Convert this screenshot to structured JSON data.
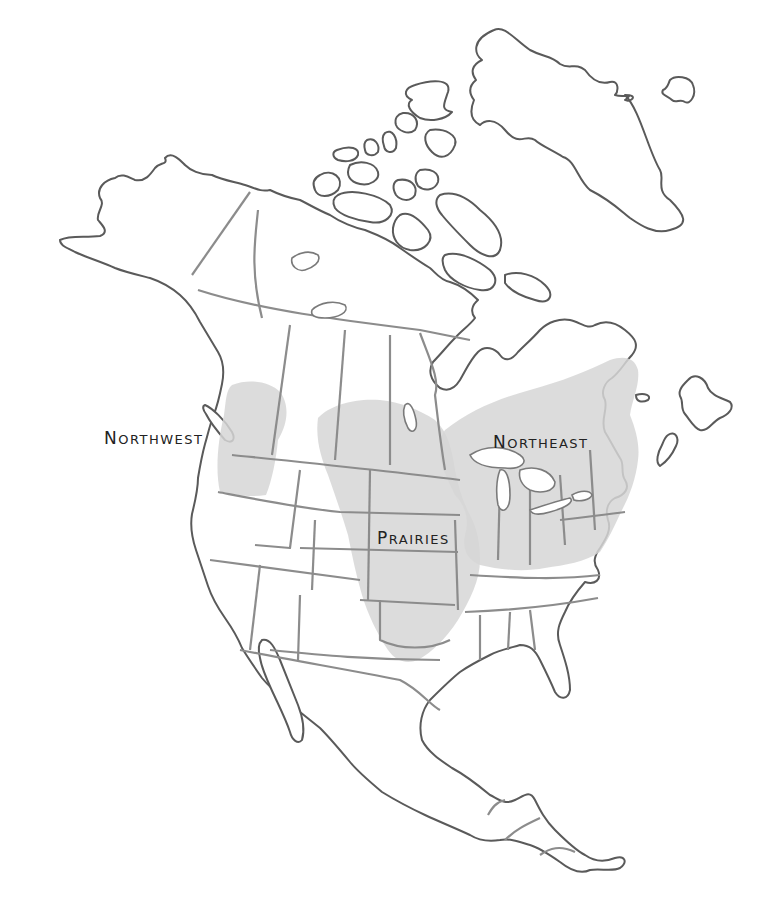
{
  "map": {
    "title": "North America regions",
    "colors": {
      "background": "#ffffff",
      "land_fill": "#ffffff",
      "coastline": "#5a5a5a",
      "political_border": "#8c8c8c",
      "region_shading": "#d6d6d6",
      "label_text": "#222222"
    },
    "regions": [
      {
        "id": "northwest",
        "label": "Northwest",
        "label_display": "NORTHWEST",
        "label_position": {
          "x": 104,
          "y": 428
        }
      },
      {
        "id": "prairies",
        "label": "Prairies",
        "label_display": "PRAIRIES",
        "label_position": {
          "x": 377,
          "y": 528
        }
      },
      {
        "id": "northeast",
        "label": "Northeast",
        "label_display": "NORTHEAST",
        "label_position": {
          "x": 493,
          "y": 432
        }
      }
    ],
    "labels": {
      "northwest_first": "N",
      "northwest_rest": "ORTHWEST",
      "prairies_first": "P",
      "prairies_rest": "RAIRIES",
      "northeast_first": "N",
      "northeast_rest": "ORTHEAST"
    }
  }
}
